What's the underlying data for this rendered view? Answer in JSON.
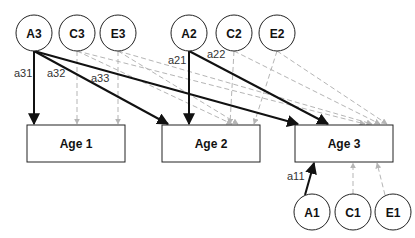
{
  "diagram": {
    "type": "path-diagram",
    "colors": {
      "solid_path": "#111111",
      "dashed_path": "#b5b5b5",
      "node_stroke": "#222222",
      "background": "#ffffff"
    },
    "latent_factors": {
      "A3": "A3",
      "C3": "C3",
      "E3": "E3",
      "A2": "A2",
      "C2": "C2",
      "E2": "E2",
      "A1": "A1",
      "C1": "C1",
      "E1": "E1"
    },
    "observed": {
      "age1": "Age 1",
      "age2": "Age 2",
      "age3": "Age 3"
    },
    "path_labels": {
      "a31": "a31",
      "a32": "a32",
      "a33": "a33",
      "a21": "a21",
      "a22": "a22",
      "a11": "a11"
    },
    "edges": [
      {
        "from": "A3",
        "to": "Age 1",
        "style": "solid",
        "label": "a31"
      },
      {
        "from": "A3",
        "to": "Age 2",
        "style": "solid",
        "label": "a32"
      },
      {
        "from": "A3",
        "to": "Age 3",
        "style": "solid",
        "label": "a33"
      },
      {
        "from": "A2",
        "to": "Age 2",
        "style": "solid",
        "label": "a21"
      },
      {
        "from": "A2",
        "to": "Age 3",
        "style": "solid",
        "label": "a22"
      },
      {
        "from": "A1",
        "to": "Age 3",
        "style": "solid",
        "label": "a11"
      },
      {
        "from": "C3",
        "to": "Age 1",
        "style": "dashed"
      },
      {
        "from": "C3",
        "to": "Age 2",
        "style": "dashed"
      },
      {
        "from": "C3",
        "to": "Age 3",
        "style": "dashed"
      },
      {
        "from": "E3",
        "to": "Age 1",
        "style": "dashed"
      },
      {
        "from": "E3",
        "to": "Age 2",
        "style": "dashed"
      },
      {
        "from": "E3",
        "to": "Age 3",
        "style": "dashed"
      },
      {
        "from": "C2",
        "to": "Age 2",
        "style": "dashed"
      },
      {
        "from": "C2",
        "to": "Age 3",
        "style": "dashed"
      },
      {
        "from": "E2",
        "to": "Age 2",
        "style": "dashed"
      },
      {
        "from": "E2",
        "to": "Age 3",
        "style": "dashed"
      },
      {
        "from": "C1",
        "to": "Age 3",
        "style": "dashed"
      },
      {
        "from": "E1",
        "to": "Age 3",
        "style": "dashed"
      }
    ]
  }
}
